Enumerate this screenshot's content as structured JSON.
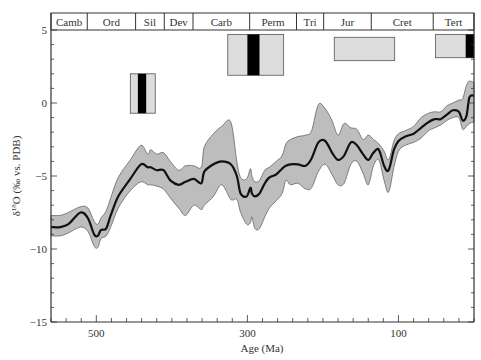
{
  "chart_data": {
    "type": "area",
    "title": "",
    "xlabel": "Age (Ma)",
    "ylabel": "δ18O (‰ vs. PDB)",
    "ylabel_parts": {
      "delta": "δ",
      "sup": "18",
      "rest": "O (‰ vs. PDB)"
    },
    "xlim": [
      560,
      0
    ],
    "ylim": [
      -15,
      5
    ],
    "x_ticks_major": [
      500,
      300,
      100
    ],
    "x_tick_labels": [
      "500",
      "300",
      "100"
    ],
    "x_ticks_minor_step": 20,
    "y_ticks_major": [
      5,
      0,
      -5,
      -10,
      -15
    ],
    "y_tick_labels": [
      "5",
      "0",
      "−5",
      "−10",
      "−15"
    ],
    "y_ticks_minor_step": 1,
    "grid": false,
    "periods": [
      {
        "label": "Camb",
        "start": 560,
        "end": 512
      },
      {
        "label": "Ord",
        "start": 512,
        "end": 448
      },
      {
        "label": "Sil",
        "start": 448,
        "end": 410
      },
      {
        "label": "Dev",
        "start": 410,
        "end": 372
      },
      {
        "label": "Carb",
        "start": 372,
        "end": 297
      },
      {
        "label": "Perm",
        "start": 297,
        "end": 235
      },
      {
        "label": "Tri",
        "start": 235,
        "end": 199
      },
      {
        "label": "Jur",
        "start": 199,
        "end": 136
      },
      {
        "label": "Cret",
        "start": 136,
        "end": 54
      },
      {
        "label": "Tert",
        "start": 54,
        "end": 0
      }
    ],
    "glaciation_boxes": [
      {
        "name": "ordovician-silurian-glaciation",
        "start": 455,
        "end": 422,
        "ytop": 2.0,
        "ybottom": -0.7,
        "black_start": 445,
        "black_end": 434
      },
      {
        "name": "carboniferous-permian-glaciation",
        "start": 326,
        "end": 252,
        "ytop": 4.7,
        "ybottom": 1.9,
        "black_start": 300,
        "black_end": 284
      },
      {
        "name": "jurassic-cretaceous-cool-period",
        "start": 185,
        "end": 105,
        "ytop": 4.5,
        "ybottom": 2.9,
        "black_start": null,
        "black_end": null
      },
      {
        "name": "tertiary-glaciation",
        "start": 51,
        "end": 0,
        "ytop": 4.7,
        "ybottom": 3.1,
        "black_start": 11,
        "black_end": 0
      }
    ],
    "series": [
      {
        "name": "mean",
        "x": [
          560,
          548,
          537,
          521,
          511,
          503,
          498,
          494,
          487,
          481,
          471,
          455,
          441,
          432,
          428,
          420,
          411,
          402,
          391,
          382,
          371,
          361,
          357,
          345,
          334,
          322,
          314,
          309,
          301,
          296,
          294,
          290,
          284,
          277,
          271,
          262,
          254,
          249,
          243,
          233,
          223,
          215,
          206,
          197,
          188,
          180,
          172,
          163,
          155,
          147,
          140,
          133,
          126,
          119,
          113,
          106,
          100,
          91,
          80,
          70,
          60,
          52,
          44,
          36,
          28,
          20,
          15,
          10,
          6,
          0
        ],
        "y": [
          -8.5,
          -8.5,
          -8.3,
          -7.5,
          -7.9,
          -9.0,
          -9.1,
          -8.7,
          -8.6,
          -7.7,
          -6.4,
          -5.2,
          -4.2,
          -4.4,
          -4.4,
          -4.6,
          -4.6,
          -5.3,
          -5.6,
          -5.4,
          -5.2,
          -5.5,
          -4.7,
          -4.2,
          -4.0,
          -4.2,
          -5.0,
          -6.2,
          -6.4,
          -5.8,
          -6.2,
          -6.4,
          -6.2,
          -5.5,
          -5.1,
          -4.9,
          -4.5,
          -4.3,
          -4.2,
          -4.2,
          -4.3,
          -3.8,
          -2.7,
          -2.6,
          -3.4,
          -3.9,
          -3.6,
          -2.7,
          -2.9,
          -3.5,
          -3.9,
          -3.4,
          -3.2,
          -4.3,
          -4.6,
          -3.2,
          -2.6,
          -2.3,
          -2.1,
          -1.7,
          -1.3,
          -1.1,
          -1.1,
          -0.8,
          -0.5,
          -0.6,
          -1.2,
          -0.9,
          0.4,
          0.5
        ]
      },
      {
        "name": "upper_bound",
        "x": [
          560,
          548,
          537,
          521,
          511,
          503,
          498,
          494,
          487,
          481,
          471,
          455,
          441,
          432,
          428,
          420,
          411,
          402,
          391,
          382,
          371,
          361,
          357,
          345,
          334,
          322,
          314,
          309,
          301,
          296,
          294,
          290,
          284,
          277,
          271,
          262,
          254,
          249,
          243,
          233,
          223,
          215,
          206,
          197,
          188,
          180,
          172,
          163,
          155,
          147,
          140,
          133,
          126,
          119,
          113,
          106,
          100,
          91,
          80,
          70,
          60,
          52,
          44,
          36,
          28,
          20,
          15,
          10,
          6,
          0
        ],
        "y": [
          -7.7,
          -7.7,
          -7.5,
          -7.1,
          -7.2,
          -8.1,
          -8.3,
          -7.9,
          -7.4,
          -6.5,
          -5.1,
          -3.9,
          -2.9,
          -3.5,
          -3.2,
          -3.5,
          -3.4,
          -4.0,
          -4.6,
          -4.3,
          -4.3,
          -4.4,
          -3.0,
          -2.1,
          -1.6,
          -1.3,
          -4.0,
          -5.1,
          -5.2,
          -4.5,
          -5.0,
          -5.4,
          -5.3,
          -4.6,
          -4.4,
          -4.0,
          -3.6,
          -2.8,
          -2.5,
          -2.3,
          -2.2,
          -1.9,
          -0.1,
          -0.4,
          -1.2,
          -2.2,
          -1.4,
          -1.7,
          -1.8,
          -2.5,
          -2.2,
          -2.5,
          -2.8,
          -3.3,
          -3.9,
          -2.6,
          -2.1,
          -1.9,
          -1.6,
          -1.0,
          -0.7,
          -0.6,
          -0.6,
          -0.2,
          0.0,
          0.2,
          0.3,
          1.2,
          1.5,
          1.4
        ]
      },
      {
        "name": "lower_bound",
        "x": [
          560,
          548,
          537,
          521,
          511,
          503,
          498,
          494,
          487,
          481,
          471,
          455,
          441,
          432,
          428,
          420,
          411,
          402,
          391,
          382,
          371,
          361,
          357,
          345,
          334,
          322,
          314,
          309,
          301,
          296,
          294,
          290,
          284,
          277,
          271,
          262,
          254,
          249,
          243,
          233,
          223,
          215,
          206,
          197,
          188,
          180,
          172,
          163,
          155,
          147,
          140,
          133,
          126,
          119,
          113,
          106,
          100,
          91,
          80,
          70,
          60,
          52,
          44,
          36,
          28,
          20,
          15,
          10,
          6,
          0
        ],
        "y": [
          -9.1,
          -9.1,
          -8.9,
          -8.5,
          -8.8,
          -9.8,
          -9.9,
          -9.3,
          -9.1,
          -8.5,
          -7.2,
          -6.0,
          -5.4,
          -5.6,
          -5.6,
          -5.7,
          -5.9,
          -6.5,
          -7.2,
          -7.7,
          -7.0,
          -7.3,
          -7.0,
          -6.4,
          -5.6,
          -6.6,
          -6.6,
          -7.5,
          -8.3,
          -8.2,
          -7.8,
          -8.6,
          -8.6,
          -7.8,
          -7.2,
          -6.7,
          -6.2,
          -5.3,
          -5.6,
          -5.5,
          -5.9,
          -5.8,
          -4.7,
          -4.2,
          -4.9,
          -5.6,
          -5.5,
          -4.2,
          -4.0,
          -4.8,
          -5.6,
          -4.3,
          -3.9,
          -5.3,
          -6.1,
          -4.4,
          -3.3,
          -2.9,
          -2.7,
          -2.4,
          -1.9,
          -1.7,
          -1.5,
          -1.2,
          -1.0,
          -1.0,
          -1.8,
          -1.6,
          -1.4,
          -1.3
        ]
      }
    ],
    "colors": {
      "band_fill": "#bdbdbd",
      "band_stroke": "#555555",
      "mean_line": "#111111",
      "box_fill": "#dcdcdc",
      "box_black": "#000000",
      "axis": "#333333"
    }
  }
}
